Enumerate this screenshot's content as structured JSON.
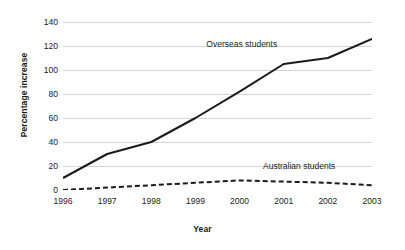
{
  "chart_data": {
    "type": "line",
    "title": "",
    "subtitle": "",
    "xlabel": "Year",
    "ylabel": "Percentage increase",
    "categories": [
      "1996",
      "1997",
      "1998",
      "1999",
      "2000",
      "2001",
      "2002",
      "2003"
    ],
    "x": [
      1996,
      1997,
      1998,
      1999,
      2000,
      2001,
      2002,
      2003
    ],
    "xlim": [
      1996,
      2003
    ],
    "ylim": [
      0,
      140
    ],
    "yticks": [
      0,
      20,
      40,
      60,
      80,
      100,
      120,
      140
    ],
    "ytick_labels": [
      "0",
      "20",
      "40",
      "60",
      "80",
      "100",
      "120",
      "140"
    ],
    "xtick_labels": [
      "1996",
      "1997",
      "1998",
      "1999",
      "2000",
      "2001",
      "2002",
      "2003"
    ],
    "grid": "horizontal",
    "legend": "inline-annotations",
    "series": [
      {
        "name": "Overseas students",
        "values": [
          10,
          30,
          40,
          60,
          82,
          105,
          110,
          126
        ],
        "style": "solid",
        "color": "#1a1a1a",
        "width": 2.0,
        "label_x": 2000.05,
        "label_y": 122
      },
      {
        "name": "Australian students",
        "values": [
          0,
          2,
          4,
          6,
          8,
          7,
          6,
          4
        ],
        "style": "dashed",
        "color": "#1a1a1a",
        "width": 2.0,
        "label_x": 2001.35,
        "label_y": 20
      }
    ],
    "colors": {
      "background": "#ffffff",
      "gridline": "#d4d4d4",
      "axis": "#8a8a8a",
      "text": "#1a1a1a"
    }
  }
}
